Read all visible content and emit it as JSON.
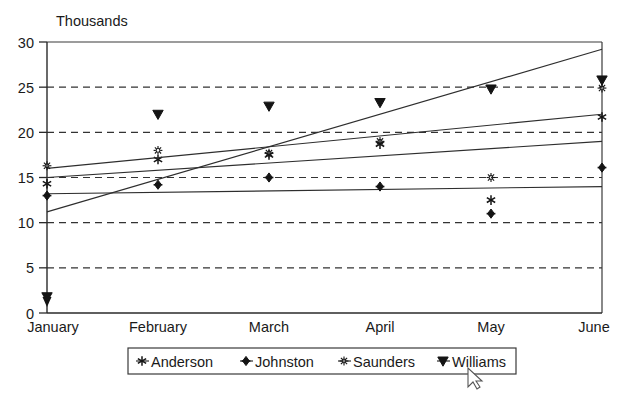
{
  "chart_data": {
    "type": "line",
    "title": "",
    "unit_label": "Thousands",
    "xlabel": "",
    "ylabel": "",
    "categories": [
      "January",
      "February",
      "March",
      "April",
      "May",
      "June"
    ],
    "ylim": [
      0,
      30
    ],
    "yticks": [
      0,
      5,
      10,
      15,
      20,
      25,
      30
    ],
    "grid": "horizontal-dashed",
    "legend_position": "bottom",
    "series": [
      {
        "name": "Anderson",
        "marker": "star-six",
        "values": [
          14.3,
          17.0,
          17.5,
          18.7,
          12.5,
          21.7
        ],
        "trend_start": 15.0,
        "trend_end": 19.0
      },
      {
        "name": "Johnston",
        "marker": "diamond",
        "values": [
          13.0,
          14.2,
          15.0,
          14.0,
          11.0,
          16.1
        ],
        "trend_start": 13.2,
        "trend_end": 14.0
      },
      {
        "name": "Saunders",
        "marker": "asterisk-open",
        "values": [
          16.3,
          18.0,
          17.7,
          19.0,
          15.0,
          24.9
        ],
        "trend_start": 16.0,
        "trend_end": 22.0
      },
      {
        "name": "Williams",
        "marker": "triangle-down",
        "values": [
          1.8,
          22.0,
          22.9,
          23.3,
          24.8,
          25.8
        ],
        "trend_start": 11.2,
        "trend_end": 29.2
      }
    ]
  },
  "legend": {
    "items": [
      {
        "label": "Anderson",
        "marker": "star-six"
      },
      {
        "label": "Johnston",
        "marker": "diamond"
      },
      {
        "label": "Saunders",
        "marker": "asterisk-open"
      },
      {
        "label": "Williams",
        "marker": "triangle-down"
      }
    ]
  },
  "cursor": {
    "name": "mouse-pointer",
    "x": 468,
    "y": 368
  }
}
